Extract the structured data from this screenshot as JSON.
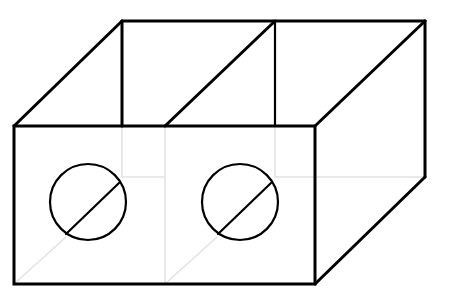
{
  "figure": {
    "width": 459,
    "height": 301,
    "colors": {
      "line": "#000000",
      "hidden_line": "#e2e2e2",
      "background": "#ffffff"
    },
    "compartments": 2,
    "holes": [
      {
        "cx": 88,
        "cy": 202,
        "r": 38
      },
      {
        "cx": 240,
        "cy": 202,
        "r": 38
      }
    ]
  }
}
